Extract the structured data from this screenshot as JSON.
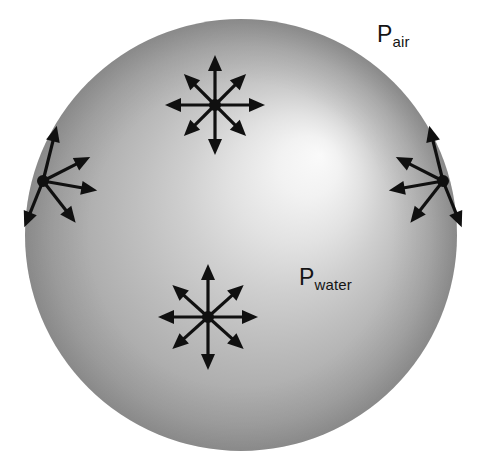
{
  "figure": {
    "type": "physics-diagram",
    "width": 485,
    "height": 471,
    "background_color": "#ffffff"
  },
  "labels": {
    "p_air": {
      "base": "P",
      "subscript": "air"
    },
    "p_water": {
      "base": "P",
      "subscript": "water"
    }
  },
  "sphere": {
    "name": "water-droplet",
    "center_x": 241,
    "center_y": 235,
    "radius": 216,
    "fill_light": "#f7f7f7",
    "fill_mid": "#bdbdbd",
    "fill_edge": "#949494",
    "highlight_x": 320,
    "highlight_y": 155
  },
  "arrow_style": {
    "stroke_color": "#101010",
    "stroke_width": 3.2,
    "head_length": 16,
    "head_half_width": 7,
    "dot_radius": 6
  },
  "arrow_clusters": [
    {
      "name": "interior-point-upper",
      "description": "Isotropic pressure at an interior point near the top of the droplet",
      "center_x": 215,
      "center_y": 105,
      "arrow_count": 8,
      "arrows": [
        {
          "angle_deg": 90,
          "length": 50
        },
        {
          "angle_deg": 45,
          "length": 44
        },
        {
          "angle_deg": 0,
          "length": 50
        },
        {
          "angle_deg": -45,
          "length": 44
        },
        {
          "angle_deg": -90,
          "length": 50
        },
        {
          "angle_deg": -135,
          "length": 44
        },
        {
          "angle_deg": 180,
          "length": 50
        },
        {
          "angle_deg": 135,
          "length": 44
        }
      ]
    },
    {
      "name": "interior-point-lower",
      "description": "Isotropic pressure at an interior point near the bottom of the droplet",
      "center_x": 208,
      "center_y": 317,
      "arrow_count": 8,
      "arrows": [
        {
          "angle_deg": 90,
          "length": 53
        },
        {
          "angle_deg": 42,
          "length": 48
        },
        {
          "angle_deg": 0,
          "length": 50
        },
        {
          "angle_deg": -42,
          "length": 48
        },
        {
          "angle_deg": -90,
          "length": 53
        },
        {
          "angle_deg": -138,
          "length": 48
        },
        {
          "angle_deg": 180,
          "length": 50
        },
        {
          "angle_deg": 138,
          "length": 48
        }
      ]
    },
    {
      "name": "surface-point-left",
      "description": "Pressure at a point on the left surface of the droplet",
      "center_x": 43,
      "center_y": 181,
      "arrow_count": 5,
      "arrows": [
        {
          "angle_deg": 76,
          "length": 57
        },
        {
          "angle_deg": 27,
          "length": 53
        },
        {
          "angle_deg": -10,
          "length": 55
        },
        {
          "angle_deg": -52,
          "length": 53
        },
        {
          "angle_deg": -112,
          "length": 50
        }
      ]
    },
    {
      "name": "surface-point-right",
      "description": "Pressure at a point on the right surface of the droplet",
      "center_x": 443,
      "center_y": 181,
      "arrow_count": 5,
      "arrows": [
        {
          "angle_deg": 104,
          "length": 57
        },
        {
          "angle_deg": 153,
          "length": 53
        },
        {
          "angle_deg": 190,
          "length": 55
        },
        {
          "angle_deg": 232,
          "length": 53
        },
        {
          "angle_deg": 292,
          "length": 50
        }
      ]
    }
  ]
}
